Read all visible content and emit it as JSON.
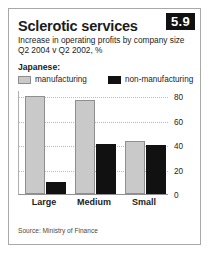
{
  "badge": "5.9",
  "title": "Sclerotic services",
  "subtitle_line1": "Increase in operating profits by company size",
  "subtitle_line2": "Q2 2004 v Q2 2002, %",
  "legend_group_label": "Japanese:",
  "source": "Source: Ministry of Finance",
  "colors": {
    "manufacturing": "#c9c9c9",
    "non_manufacturing": "#111111",
    "badge_background": "#111111",
    "frame_border": "#a8a8a8",
    "gridline": "#bdbdbd"
  },
  "chart_data": {
    "type": "bar",
    "title": "Sclerotic services",
    "subtitle": "Increase in operating profits by company size",
    "xlabel": "",
    "ylabel": "Q2 2004 v Q2 2002, %",
    "categories": [
      "Large",
      "Medium",
      "Small"
    ],
    "series": [
      {
        "name": "manufacturing",
        "values": [
          80,
          77,
          43
        ],
        "color": "#c9c9c9"
      },
      {
        "name": "non-manufacturing",
        "values": [
          10,
          41,
          40
        ],
        "color": "#111111"
      }
    ],
    "ylim": [
      0,
      85
    ],
    "yticks": [
      0,
      20,
      40,
      60,
      80
    ],
    "ytick_labels": [
      "0",
      "20",
      "40",
      "60",
      "80"
    ],
    "grid": true,
    "grid_style": "dotted-horizontal",
    "legend_position": "above-plot",
    "legend_entries": [
      "manufacturing",
      "non-manufacturing"
    ],
    "annotations": [
      "Japanese:"
    ]
  }
}
